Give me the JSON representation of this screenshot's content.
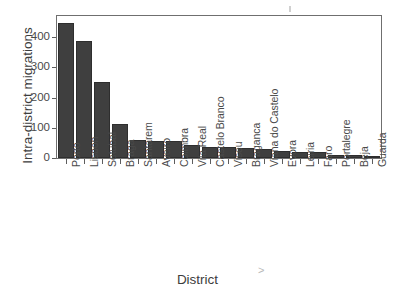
{
  "chart_data": {
    "type": "bar",
    "title": "",
    "xlabel": "District",
    "ylabel": "Intra-district migrations",
    "categories": [
      "Porto",
      "Lisbon",
      "Setubal",
      "Braga",
      "Santarem",
      "Aveiro",
      "Coimbra",
      "Vila Real",
      "Castelo Branco",
      "Viseu",
      "Braganca",
      "Viana do Castelo",
      "Evora",
      "Leiria",
      "Faro",
      "Portalegre",
      "Beja",
      "Guarda"
    ],
    "values": [
      447,
      388,
      250,
      112,
      58,
      56,
      55,
      43,
      38,
      38,
      32,
      30,
      24,
      21,
      19,
      10,
      10,
      1
    ],
    "ylim": [
      0,
      470
    ],
    "yticks": [
      0,
      100,
      200,
      300,
      400
    ],
    "ytick_labels": [
      "0",
      "100",
      "200",
      "300",
      "400"
    ],
    "grid": false,
    "legend": null,
    "bar_color": "#3f3f3f",
    "axis_color": "#6f6f6f",
    "text_color": "#4a4a4a"
  },
  "axes": {
    "y_title": "Intra-district migrations",
    "x_title": "District"
  },
  "artifacts": {
    "stray_mark": ">"
  }
}
